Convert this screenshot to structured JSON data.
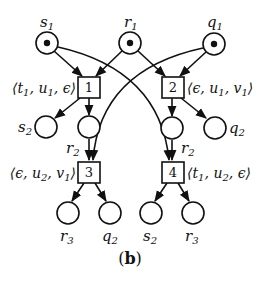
{
  "caption": {
    "open": "(",
    "letter": "b",
    "close": ")"
  },
  "places": {
    "s1": {
      "name": "s",
      "sub": "1",
      "token": true
    },
    "r1": {
      "name": "r",
      "sub": "1",
      "token": true
    },
    "q1": {
      "name": "q",
      "sub": "1",
      "token": true
    },
    "s2_left": {
      "name": "s",
      "sub": "2",
      "token": false
    },
    "r2_left": {
      "name": "r",
      "sub": "2",
      "token": false
    },
    "r2_right": {
      "name": "r",
      "sub": "2",
      "token": false
    },
    "q2_right": {
      "name": "q",
      "sub": "2",
      "token": false
    },
    "r3_left": {
      "name": "r",
      "sub": "3",
      "token": false
    },
    "q2_bottom": {
      "name": "q",
      "sub": "2",
      "token": false
    },
    "s2_bottom": {
      "name": "s",
      "sub": "2",
      "token": false
    },
    "r3_right": {
      "name": "r",
      "sub": "3",
      "token": false
    }
  },
  "transitions": {
    "t1": {
      "id": "1",
      "label": {
        "a": "t",
        "a_sub": "1",
        "b": "u",
        "b_sub": "1",
        "c": "ϵ",
        "c_sub": ""
      }
    },
    "t2": {
      "id": "2",
      "label": {
        "a": "ϵ",
        "a_sub": "",
        "b": "u",
        "b_sub": "1",
        "c": "v",
        "c_sub": "1"
      }
    },
    "t3": {
      "id": "3",
      "label": {
        "a": "ϵ",
        "a_sub": "",
        "b": "u",
        "b_sub": "2",
        "c": "v",
        "c_sub": "1"
      }
    },
    "t4": {
      "id": "4",
      "label": {
        "a": "t",
        "a_sub": "1",
        "b": "u",
        "b_sub": "2",
        "c": "ϵ",
        "c_sub": ""
      }
    }
  },
  "arcs": [
    {
      "from": "s1",
      "to": "t1"
    },
    {
      "from": "r1",
      "to": "t1"
    },
    {
      "from": "r1",
      "to": "t2"
    },
    {
      "from": "q1",
      "to": "t2"
    },
    {
      "from": "s1",
      "to": "t4"
    },
    {
      "from": "q1",
      "to": "t3"
    },
    {
      "from": "t1",
      "to": "s2_left"
    },
    {
      "from": "t1",
      "to": "r2_left"
    },
    {
      "from": "t2",
      "to": "r2_right"
    },
    {
      "from": "t2",
      "to": "q2_right"
    },
    {
      "from": "r2_left",
      "to": "t3"
    },
    {
      "from": "r2_right",
      "to": "t4"
    },
    {
      "from": "t3",
      "to": "r3_left"
    },
    {
      "from": "t3",
      "to": "q2_bottom"
    },
    {
      "from": "t4",
      "to": "s2_bottom"
    },
    {
      "from": "t4",
      "to": "r3_right"
    }
  ],
  "colors": {
    "stroke": "#111111",
    "background": "#ffffff"
  }
}
